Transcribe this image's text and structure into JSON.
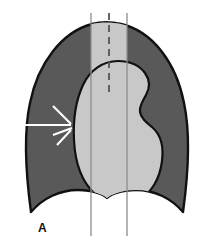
{
  "figure": {
    "panel_label": "A",
    "type": "medical-illustration",
    "colors": {
      "background": "#ffffff",
      "lung_field": "#595959",
      "mediastinum": "#c8c8c8",
      "outline": "#111111",
      "reference_line": "#8c8c8c",
      "marker": "#ffffff"
    },
    "regions": [
      {
        "name": "lung-fields",
        "label": "Lung fields",
        "fill": "#595959"
      },
      {
        "name": "mediastinal-band",
        "label": "Mediastinal band",
        "fill": "#c8c8c8"
      },
      {
        "name": "cardiac-silhouette",
        "label": "Cardiac silhouette",
        "fill": "#c8c8c8"
      }
    ],
    "reference_lines": [
      {
        "name": "left-paramedian-line",
        "style": "solid",
        "x": 91,
        "y1": 13,
        "y2": 236
      },
      {
        "name": "midline",
        "style": "dashed",
        "x": 109,
        "y1": 13,
        "y2": 96
      },
      {
        "name": "right-paramedian-line",
        "style": "solid",
        "x": 127,
        "y1": 13,
        "y2": 236
      }
    ],
    "markers": [
      {
        "name": "pointer-shaft",
        "style": "solid-white-line"
      },
      {
        "name": "pointer-fan-upper",
        "style": "solid-white-line"
      },
      {
        "name": "pointer-fan-middle",
        "style": "solid-white-line"
      },
      {
        "name": "pointer-fan-lower",
        "style": "solid-white-line"
      }
    ]
  }
}
